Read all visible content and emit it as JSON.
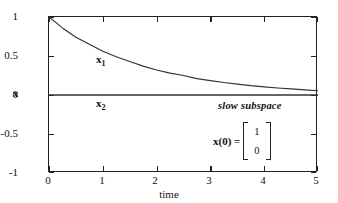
{
  "figure": {
    "background": "#ffffff",
    "axis_color": "#222222",
    "curve_color": "#333333"
  },
  "axes": {
    "x_name": "time",
    "y_name": "x",
    "x_ticks": [
      "0",
      "1",
      "2",
      "3",
      "4",
      "5"
    ],
    "y_ticks": [
      "1",
      "0.5",
      "0",
      "-0.5",
      "-1"
    ]
  },
  "annotations": {
    "curve1_label": "x",
    "curve1_sub": "1",
    "curve2_label": "x",
    "curve2_sub": "2",
    "subspace_text": "slow subspace",
    "initial_condition_lhs": "x(0) =",
    "initial_condition_vector": [
      "1",
      "0"
    ]
  },
  "chart_data": {
    "type": "line",
    "title": "",
    "xlabel": "time",
    "ylabel": "x",
    "xlim": [
      0,
      5
    ],
    "ylim": [
      -1,
      1
    ],
    "xticks": [
      0,
      1,
      2,
      3,
      4,
      5
    ],
    "yticks": [
      -1,
      -0.5,
      0,
      0.5,
      1
    ],
    "grid": false,
    "legend": "none",
    "series": [
      {
        "name": "x1",
        "label": "x_1",
        "x": [
          0,
          0.25,
          0.5,
          0.75,
          1.0,
          1.25,
          1.5,
          1.75,
          2.0,
          2.25,
          2.5,
          2.75,
          3.0,
          3.25,
          3.5,
          3.75,
          4.0,
          4.25,
          4.5,
          4.75,
          5.0
        ],
        "values": [
          1.0,
          0.86,
          0.74,
          0.65,
          0.56,
          0.49,
          0.43,
          0.37,
          0.32,
          0.28,
          0.25,
          0.21,
          0.185,
          0.16,
          0.14,
          0.12,
          0.105,
          0.09,
          0.078,
          0.066,
          0.055
        ]
      },
      {
        "name": "x2",
        "label": "x_2",
        "x": [
          0,
          5
        ],
        "values": [
          0,
          0
        ]
      }
    ],
    "annotations": [
      {
        "text": "slow subspace",
        "x": 4.0,
        "y": -0.08
      },
      {
        "text": "x(0) = [1; 0]",
        "x": 4.0,
        "y": -0.42
      }
    ]
  }
}
